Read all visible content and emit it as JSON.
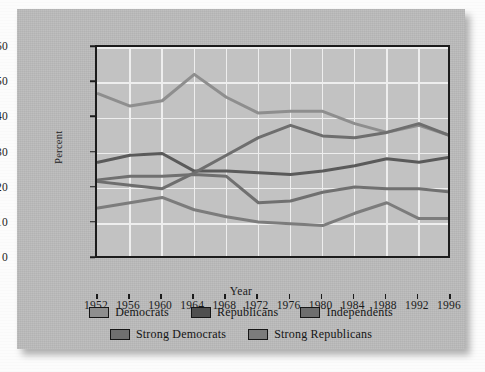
{
  "figure": {
    "axis_label_x": "Year",
    "axis_label_y": "Percent"
  },
  "chart_data": {
    "type": "line",
    "title": "",
    "xlabel": "Year",
    "ylabel": "Percent",
    "x": [
      1952,
      1956,
      1960,
      1964,
      1968,
      1972,
      1976,
      1980,
      1984,
      1988,
      1992,
      1996
    ],
    "categories": [
      "1952",
      "1956",
      "1960",
      "1964",
      "1968",
      "1972",
      "1976",
      "1980",
      "1984",
      "1988",
      "1992",
      "1996"
    ],
    "xlim": [
      1952,
      1996
    ],
    "ylim": [
      0,
      60
    ],
    "yticks": [
      0,
      10,
      20,
      30,
      40,
      50,
      60
    ],
    "grid": true,
    "legend_position": "below",
    "series": [
      {
        "name": "Democrats",
        "color": "#8e8e8e",
        "values": [
          47,
          43.5,
          45,
          52.5,
          46,
          41.5,
          42,
          42,
          38.5,
          36,
          38,
          35
        ]
      },
      {
        "name": "Republicans",
        "color": "#5a5a5a",
        "values": [
          27.5,
          29.5,
          30,
          25,
          25,
          24.5,
          24,
          25,
          26.5,
          28.5,
          27.5,
          29
        ]
      },
      {
        "name": "Independents",
        "color": "#6e6e6e",
        "values": [
          22,
          21,
          20,
          24.5,
          29.5,
          34.5,
          38,
          35,
          34.5,
          36,
          38.5,
          35
        ]
      },
      {
        "name": "Strong Democrats",
        "color": "#707070",
        "values": [
          22.5,
          23.5,
          23.5,
          24,
          23.5,
          16,
          16.5,
          19,
          20.5,
          20,
          20,
          19
        ]
      },
      {
        "name": "Strong Republicans",
        "color": "#7c7c7c",
        "values": [
          14.5,
          16,
          17.5,
          14,
          12,
          10.5,
          10,
          9.5,
          13,
          16,
          11.5,
          11.5
        ]
      }
    ]
  },
  "legend": {
    "rows": [
      [
        {
          "label": "Democrats",
          "color": "#8e8e8e"
        },
        {
          "label": "Republicans",
          "color": "#4f4f4f"
        },
        {
          "label": "Independents",
          "color": "#6e6e6e"
        }
      ],
      [
        {
          "label": "Strong Democrats",
          "color": "#707070"
        },
        {
          "label": "Strong Republicans",
          "color": "#7c7c7c"
        }
      ]
    ]
  }
}
